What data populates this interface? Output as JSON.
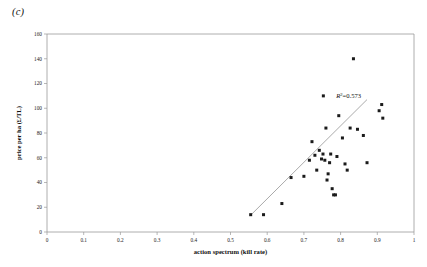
{
  "figure": {
    "panel_label": "(c)"
  },
  "chart_data": {
    "type": "scatter",
    "title": "",
    "xlabel": "action spectrum (kill rate)",
    "ylabel": "price per ha (£/TL)",
    "xlim": [
      0,
      1
    ],
    "ylim": [
      0,
      160
    ],
    "xticks": [
      0,
      0.1,
      0.2,
      0.3,
      0.4,
      0.5,
      0.6,
      0.7,
      0.8,
      0.9,
      1
    ],
    "xtick_labels": [
      "0",
      "0.1",
      "0.2",
      "0.3",
      "0.4",
      "0.5",
      "0.6",
      "0.7",
      "0.8",
      "0.9",
      "1"
    ],
    "yticks": [
      0,
      20,
      40,
      60,
      80,
      100,
      120,
      140,
      160
    ],
    "ytick_labels": [
      "0",
      "20",
      "40",
      "60",
      "80",
      "100",
      "120",
      "140",
      "160"
    ],
    "grid": false,
    "legend": false,
    "marker_shape": "square",
    "marker_color": "#1b1b1b",
    "points": [
      [
        0.555,
        14
      ],
      [
        0.59,
        14
      ],
      [
        0.64,
        23
      ],
      [
        0.665,
        44
      ],
      [
        0.7,
        45
      ],
      [
        0.715,
        58
      ],
      [
        0.722,
        73
      ],
      [
        0.73,
        62
      ],
      [
        0.735,
        50
      ],
      [
        0.742,
        66
      ],
      [
        0.748,
        59
      ],
      [
        0.752,
        63
      ],
      [
        0.757,
        58
      ],
      [
        0.76,
        84
      ],
      [
        0.763,
        42
      ],
      [
        0.766,
        47
      ],
      [
        0.77,
        56
      ],
      [
        0.773,
        63
      ],
      [
        0.777,
        35
      ],
      [
        0.781,
        30
      ],
      [
        0.786,
        30
      ],
      [
        0.79,
        61
      ],
      [
        0.795,
        94
      ],
      [
        0.805,
        76
      ],
      [
        0.812,
        55
      ],
      [
        0.818,
        50
      ],
      [
        0.826,
        84
      ],
      [
        0.835,
        140
      ],
      [
        0.846,
        83
      ],
      [
        0.862,
        78
      ],
      [
        0.872,
        56
      ],
      [
        0.905,
        98
      ],
      [
        0.912,
        103
      ],
      [
        0.915,
        92
      ]
    ],
    "trendline": {
      "x": [
        0.553,
        0.872
      ],
      "y": [
        13,
        107
      ]
    },
    "annotation": {
      "text_prefix": "R",
      "text_sup": "2",
      "text_suffix": "=0.573",
      "full_text": "R2=0.573",
      "value": 0.573,
      "x": 0.822,
      "y": 108
    },
    "annotation_marker": {
      "x": 0.753,
      "y": 110
    }
  }
}
